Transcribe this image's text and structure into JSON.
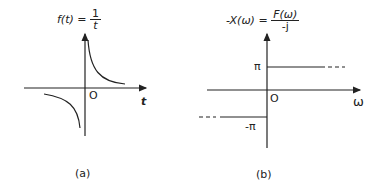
{
  "panels": [
    {
      "id": "a",
      "caption": "(a)",
      "title_lhs": "f(t) =",
      "title_num": "1",
      "title_den": "t",
      "origin_label": "O",
      "x_axis_label": "t",
      "function": "f(t) = 1/t"
    },
    {
      "id": "b",
      "caption": "(b)",
      "title_lhs": "-X(ω) =",
      "title_num": "F(ω)",
      "title_den": "-j",
      "origin_label": "O",
      "x_axis_label": "ω",
      "upper_level_label": "π",
      "lower_level_label": "-π",
      "function": "-X(ω) = π for ω>0, -π for ω<0"
    }
  ],
  "colors": {
    "ink": "#222222",
    "background": "#ffffff"
  }
}
